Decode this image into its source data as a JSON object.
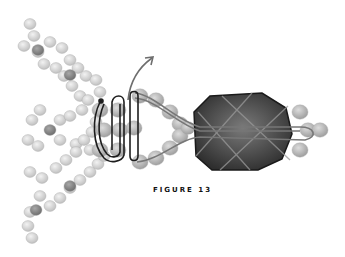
{
  "figure": {
    "caption": "FIGURE 13",
    "colors": {
      "bead_light": "#d4d4d4",
      "bead_mid": "#b8b8b8",
      "bead_dark": "#8e8e8e",
      "core": "#4a4a4a",
      "loop_line": "#1e1e1e",
      "arrow": "#6e6e6e"
    }
  }
}
